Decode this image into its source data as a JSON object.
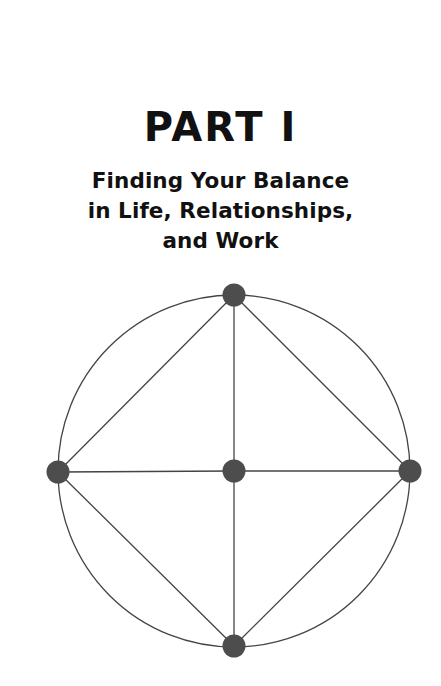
{
  "page": {
    "background_color": "#ffffff",
    "width": 441,
    "height": 686
  },
  "heading": {
    "part_title": "PART I",
    "subtitle_lines": [
      "Finding Your Balance",
      "in Life, Relationships,",
      "and Work"
    ],
    "text_color": "#111111"
  },
  "diagram": {
    "name": "balance-wheel-diagram",
    "stroke_color": "#444444",
    "node_fill_color": "#4d4d4d",
    "circle_stroke_width": 1.3,
    "edge_stroke_width": 1.3,
    "circle": {
      "cx": 234,
      "cy": 195,
      "r": 176
    },
    "nodes": [
      {
        "id": "top",
        "label": "top-node",
        "cx": 234,
        "cy": 19,
        "r": 11.5
      },
      {
        "id": "left",
        "label": "left-node",
        "cx": 58,
        "cy": 196,
        "r": 11.5
      },
      {
        "id": "right",
        "label": "right-node",
        "cx": 410,
        "cy": 195,
        "r": 11.5
      },
      {
        "id": "bottom",
        "label": "bottom-node",
        "cx": 234,
        "cy": 370,
        "r": 11.5
      },
      {
        "id": "center",
        "label": "center-node",
        "cx": 234,
        "cy": 195,
        "r": 11.5
      }
    ],
    "edges": [
      {
        "id": "top-left",
        "from": "top",
        "to": "left"
      },
      {
        "id": "top-right",
        "from": "top",
        "to": "right"
      },
      {
        "id": "left-bottom",
        "from": "left",
        "to": "bottom"
      },
      {
        "id": "right-bottom",
        "from": "right",
        "to": "bottom"
      },
      {
        "id": "top-center",
        "from": "top",
        "to": "center"
      },
      {
        "id": "left-center",
        "from": "left",
        "to": "center"
      },
      {
        "id": "right-center",
        "from": "right",
        "to": "center"
      },
      {
        "id": "bottom-center",
        "from": "bottom",
        "to": "center"
      }
    ]
  }
}
